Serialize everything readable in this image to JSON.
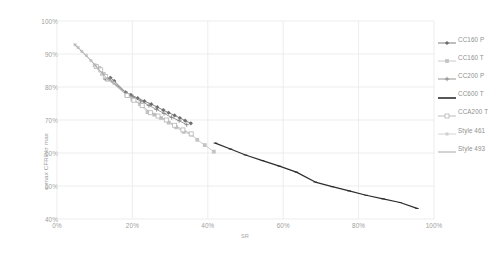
{
  "chart_data": {
    "type": "line",
    "title": "",
    "xlabel": "SR",
    "ylabel": "σ max CFRP/σ max",
    "xlim": [
      0,
      1.0
    ],
    "ylim": [
      0.4,
      1.0
    ],
    "xticks": [
      "0%",
      "20%",
      "40%",
      "60%",
      "80%",
      "100%"
    ],
    "xtick_values": [
      0,
      0.2,
      0.4,
      0.6,
      0.8,
      1.0
    ],
    "yticks": [
      "40%",
      "50%",
      "60%",
      "70%",
      "80%",
      "90%",
      "100%"
    ],
    "ytick_values": [
      0.4,
      0.5,
      0.6,
      0.7,
      0.8,
      0.9,
      1.0
    ],
    "grid": true,
    "grid_color": "#e8e8e8",
    "legend_position": "right",
    "axis_tick_label_color": "#a0a0a0",
    "series": [
      {
        "name": "CC160 P",
        "marker": "diamond",
        "color": "#6e6e6e",
        "x": [
          0.13,
          0.142,
          0.152,
          0.182,
          0.196,
          0.214,
          0.232,
          0.25,
          0.266,
          0.282,
          0.296,
          0.312,
          0.326,
          0.34,
          0.355
        ],
        "y": [
          0.826,
          0.828,
          0.818,
          0.784,
          0.776,
          0.766,
          0.757,
          0.748,
          0.739,
          0.73,
          0.722,
          0.714,
          0.706,
          0.698,
          0.69
        ]
      },
      {
        "name": "CC160 T",
        "marker": "square",
        "color": "#c4c4c4",
        "x": [
          0.1,
          0.112,
          0.124,
          0.184,
          0.2,
          0.22,
          0.24,
          0.258,
          0.276,
          0.296,
          0.316,
          0.336,
          0.356,
          0.372,
          0.392,
          0.416
        ],
        "y": [
          0.866,
          0.858,
          0.84,
          0.776,
          0.762,
          0.748,
          0.724,
          0.716,
          0.706,
          0.692,
          0.678,
          0.664,
          0.656,
          0.64,
          0.624,
          0.604
        ]
      },
      {
        "name": "CC200 P",
        "marker": "cross",
        "color": "#8a8a8a",
        "x": [
          0.128,
          0.14,
          0.15,
          0.186,
          0.202,
          0.222,
          0.244,
          0.264,
          0.284,
          0.304,
          0.324,
          0.344
        ],
        "y": [
          0.824,
          0.826,
          0.814,
          0.78,
          0.77,
          0.758,
          0.744,
          0.732,
          0.72,
          0.708,
          0.698,
          0.686
        ]
      },
      {
        "name": "CC600 T",
        "marker": "line",
        "color": "#2d2d2d",
        "x": [
          0.42,
          0.46,
          0.5,
          0.545,
          0.59,
          0.635,
          0.685,
          0.73,
          0.775,
          0.82,
          0.865,
          0.91,
          0.955
        ],
        "y": [
          0.63,
          0.612,
          0.594,
          0.577,
          0.56,
          0.542,
          0.512,
          0.498,
          0.485,
          0.472,
          0.461,
          0.45,
          0.432
        ]
      },
      {
        "name": "CCA200 T",
        "marker": "square-open",
        "color": "#b5b5b5",
        "x": [
          0.104,
          0.116,
          0.128,
          0.186,
          0.204,
          0.226,
          0.248,
          0.268,
          0.29,
          0.312,
          0.334,
          0.356
        ],
        "y": [
          0.862,
          0.852,
          0.832,
          0.774,
          0.76,
          0.744,
          0.722,
          0.712,
          0.7,
          0.684,
          0.67,
          0.658
        ]
      },
      {
        "name": "Style 461",
        "marker": "square-small",
        "color": "#cfcfcf",
        "x": [
          0.048,
          0.056,
          0.066,
          0.078,
          0.09,
          0.102,
          0.118,
          0.134,
          0.15
        ],
        "y": [
          0.928,
          0.92,
          0.908,
          0.896,
          0.88,
          0.864,
          0.838,
          0.82,
          0.812
        ]
      },
      {
        "name": "Style 493",
        "marker": "plain-line",
        "color": "#9e9e9e",
        "x": [
          0.046,
          0.06,
          0.076,
          0.094,
          0.112,
          0.132,
          0.152,
          0.176
        ],
        "y": [
          0.93,
          0.914,
          0.896,
          0.876,
          0.852,
          0.826,
          0.81,
          0.788
        ]
      }
    ]
  },
  "legend": {
    "items": [
      {
        "label": "CC160 P"
      },
      {
        "label": "CC160 T"
      },
      {
        "label": "CC200 P"
      },
      {
        "label": "CC600 T"
      },
      {
        "label": "CCA200 T"
      },
      {
        "label": "Style 461"
      },
      {
        "label": "Style 493"
      }
    ]
  }
}
